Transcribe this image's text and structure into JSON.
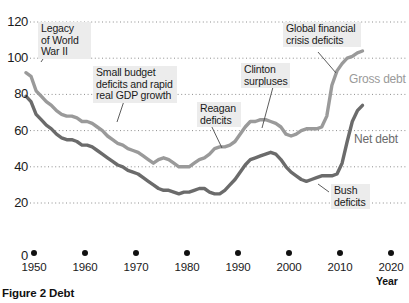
{
  "figure": {
    "caption": "Figure 2  Debt",
    "top_title_sliver": "Percentage of GDP"
  },
  "axes": {
    "y_ticks": [
      "120",
      "100",
      "80",
      "60",
      "40",
      "20",
      "0"
    ],
    "x_ticks": [
      "1950",
      "1960",
      "1970",
      "1980",
      "1990",
      "2000",
      "2010",
      "2020"
    ],
    "x_axis_title": "Year"
  },
  "series_labels": {
    "gross": "Gross debt",
    "net": "Net debt"
  },
  "annotations": [
    {
      "id": "wwii",
      "text": "Legacy\nof World\nWar II"
    },
    {
      "id": "smallbud",
      "text": "Small budget\ndeficits and rapid\nreal GDP growth"
    },
    {
      "id": "reagan",
      "text": "Reagan\ndeficits"
    },
    {
      "id": "clinton",
      "text": "Clinton\nsurpluses"
    },
    {
      "id": "gfc",
      "text": "Global financial\ncrisis deficits"
    },
    {
      "id": "bush",
      "text": "Bush\ndeficits"
    }
  ],
  "colors": {
    "gross_debt": "#9a9a9a",
    "net_debt": "#6b6b6b",
    "gridline": "#8d8d8d",
    "note_background": "#ececec",
    "axis_text": "#1a1a1a"
  },
  "chart_data": {
    "type": "line",
    "title": "Figure 2  Debt",
    "xlabel": "Year",
    "ylabel": "Percentage of GDP",
    "xlim": [
      1946,
      2021
    ],
    "ylim": [
      0,
      120
    ],
    "y_ticks": [
      0,
      20,
      40,
      60,
      80,
      100,
      120
    ],
    "x_ticks": [
      1950,
      1960,
      1970,
      1980,
      1990,
      2000,
      2010,
      2020
    ],
    "grid": "horizontal-dotted",
    "legend": "inline-right-of-series",
    "series": [
      {
        "name": "Gross debt",
        "color": "#9a9a9a",
        "x": [
          1949,
          1950,
          1951,
          1952,
          1953,
          1954,
          1955,
          1956,
          1957,
          1958,
          1959,
          1960,
          1961,
          1962,
          1963,
          1964,
          1965,
          1966,
          1967,
          1968,
          1969,
          1970,
          1971,
          1972,
          1973,
          1974,
          1975,
          1976,
          1977,
          1978,
          1979,
          1980,
          1981,
          1982,
          1983,
          1984,
          1985,
          1986,
          1987,
          1988,
          1989,
          1990,
          1991,
          1992,
          1993,
          1994,
          1995,
          1996,
          1997,
          1998,
          1999,
          2000,
          2001,
          2002,
          2003,
          2004,
          2005,
          2006,
          2007,
          2008,
          2009,
          2010,
          2011,
          2012,
          2013,
          2014,
          2015
        ],
        "y": [
          92,
          90,
          82,
          79,
          76,
          74,
          71,
          69,
          68,
          68,
          67,
          65,
          65,
          64,
          62,
          60,
          57,
          55,
          53,
          52,
          50,
          49,
          48,
          46,
          44,
          42,
          44,
          45,
          44,
          42,
          40,
          40,
          40,
          42,
          44,
          45,
          47,
          50,
          51,
          51,
          52,
          54,
          58,
          62,
          65,
          65,
          66,
          66,
          65,
          64,
          62,
          58,
          57,
          58,
          60,
          61,
          61,
          61,
          62,
          68,
          85,
          93,
          97,
          100,
          101,
          103,
          104
        ]
      },
      {
        "name": "Net debt",
        "color": "#6b6b6b",
        "x": [
          1949,
          1950,
          1951,
          1952,
          1953,
          1954,
          1955,
          1956,
          1957,
          1958,
          1959,
          1960,
          1961,
          1962,
          1963,
          1964,
          1965,
          1966,
          1967,
          1968,
          1969,
          1970,
          1971,
          1972,
          1973,
          1974,
          1975,
          1976,
          1977,
          1978,
          1979,
          1980,
          1981,
          1982,
          1983,
          1984,
          1985,
          1986,
          1987,
          1988,
          1989,
          1990,
          1991,
          1992,
          1993,
          1994,
          1995,
          1996,
          1997,
          1998,
          1999,
          2000,
          2001,
          2002,
          2003,
          2004,
          2005,
          2006,
          2007,
          2008,
          2009,
          2010,
          2011,
          2012,
          2013,
          2014,
          2015
        ],
        "y": [
          79,
          76,
          69,
          66,
          63,
          61,
          58,
          56,
          55,
          55,
          54,
          52,
          52,
          51,
          49,
          47,
          45,
          43,
          41,
          40,
          38,
          37,
          36,
          34,
          32,
          30,
          28,
          27,
          27,
          26,
          25,
          26,
          26,
          27,
          28,
          28,
          26,
          25,
          25,
          27,
          30,
          33,
          37,
          41,
          44,
          45,
          46,
          47,
          48,
          47,
          44,
          40,
          37,
          35,
          33,
          32,
          33,
          34,
          35,
          35,
          35,
          36,
          42,
          54,
          65,
          71,
          74
        ]
      }
    ],
    "annotations": [
      {
        "text": "Legacy of World War II",
        "points_to_year": 1950,
        "points_to_value": 90
      },
      {
        "text": "Small budget deficits and rapid real GDP growth",
        "points_to_year": 1972,
        "points_to_value": 46
      },
      {
        "text": "Reagan deficits",
        "points_to_year": 1986,
        "points_to_value": 47
      },
      {
        "text": "Clinton surpluses",
        "points_to_year": 1997,
        "points_to_value": 65
      },
      {
        "text": "Global financial crisis deficits",
        "points_to_year": 2009,
        "points_to_value": 85
      },
      {
        "text": "Bush deficits",
        "points_to_year": 2006,
        "points_to_value": 34
      }
    ]
  }
}
